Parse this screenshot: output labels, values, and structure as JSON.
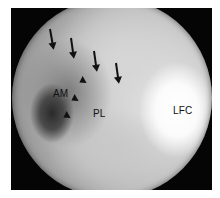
{
  "image": {
    "type": "arthroscopic view (grayscale)",
    "frame_color": "#050505",
    "labels": {
      "am": "AM",
      "pl": "PL",
      "lfc": "LFC"
    },
    "arrows_count": 4,
    "arrowheads_count": 3
  }
}
